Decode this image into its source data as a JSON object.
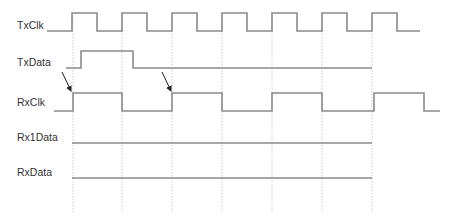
{
  "diagram": {
    "type": "timing-diagram",
    "signals": [
      {
        "name": "TxClk",
        "label_x": 17,
        "label_y": 25
      },
      {
        "name": "TxData",
        "label_x": 17,
        "label_y": 62
      },
      {
        "name": "RxClk",
        "label_x": 17,
        "label_y": 103
      },
      {
        "name": "Rx1Data",
        "label_x": 17,
        "label_y": 137
      },
      {
        "name": "RxData",
        "label_x": 17,
        "label_y": 172
      }
    ],
    "colors": {
      "waveform": "#8a8a8a",
      "gridline": "#bdbdbd",
      "arrow": "#222222",
      "text": "#333333"
    },
    "gridlines_x": [
      73,
      122,
      172,
      222,
      272,
      322,
      372
    ],
    "waveforms": {
      "TxClk": "M47,31 H72 V13 H97 V31 H122 V13 H147 V31 H172 V13 H197 V31 H222 V13 H247 V31 H272 V13 H297 V31 H322 V13 H347 V31 H372 V13 H397 V31 H420",
      "TxData": "M66,68 H81 V51 H133 V68 H372",
      "RxClk": "M54,111 H73 V93 H122 V111 H172 V93 H222 V111 H272 V93 H322 V111 H374 V93 H424 V111 H440",
      "Rx1Data": "M72,143 H372",
      "RxData": "M72,178 H372"
    },
    "arrows": [
      {
        "from": [
          62,
          72
        ],
        "to": [
          71,
          91
        ]
      },
      {
        "from": [
          162,
          72
        ],
        "to": [
          171,
          91
        ]
      }
    ]
  }
}
